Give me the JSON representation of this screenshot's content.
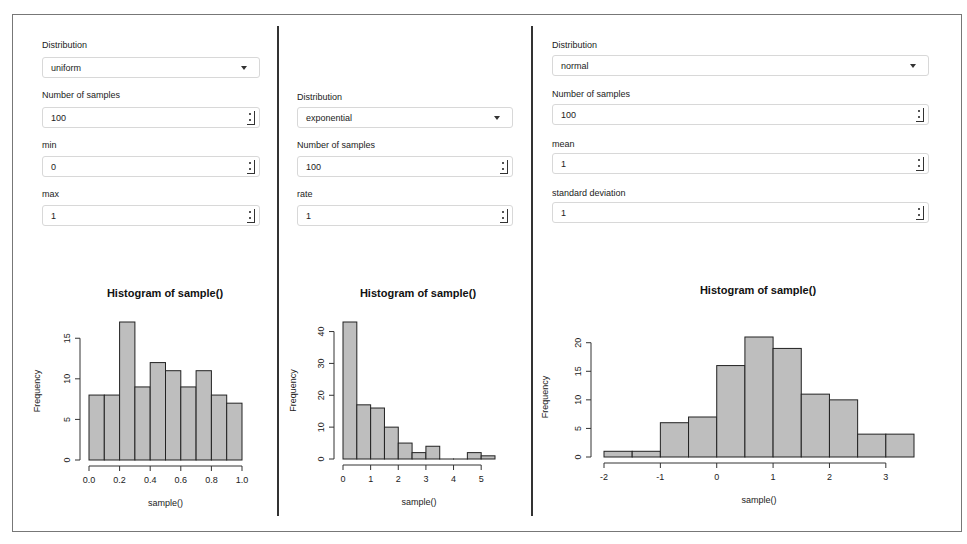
{
  "panels": [
    {
      "distribution_label": "Distribution",
      "distribution_value": "uniform",
      "fields": [
        {
          "label": "Number of samples",
          "value": "100"
        },
        {
          "label": "min",
          "value": "0"
        },
        {
          "label": "max",
          "value": "1"
        }
      ]
    },
    {
      "distribution_label": "Distribution",
      "distribution_value": "exponential",
      "fields": [
        {
          "label": "Number of samples",
          "value": "100"
        },
        {
          "label": "rate",
          "value": "1"
        }
      ]
    },
    {
      "distribution_label": "Distribution",
      "distribution_value": "normal",
      "fields": [
        {
          "label": "Number of samples",
          "value": "100"
        },
        {
          "label": "mean",
          "value": "1"
        },
        {
          "label": "standard deviation",
          "value": "1"
        }
      ]
    }
  ],
  "colors": {
    "bar_fill": "#bebebe",
    "bar_stroke": "#222222",
    "frame": "#777777",
    "divider": "#333333"
  },
  "chart_data": [
    {
      "type": "bar",
      "title": "Histogram of sample()",
      "xlabel": "sample()",
      "ylabel": "Frequency",
      "bin_edges": [
        0.0,
        0.1,
        0.2,
        0.3,
        0.4,
        0.5,
        0.6,
        0.7,
        0.8,
        0.9,
        1.0
      ],
      "values": [
        8,
        8,
        17,
        9,
        12,
        11,
        9,
        11,
        8,
        7
      ],
      "xticks": [
        "0.0",
        "0.2",
        "0.4",
        "0.6",
        "0.8",
        "1.0"
      ],
      "yticks": [
        "0",
        "5",
        "10",
        "15"
      ],
      "xlim": [
        0,
        1
      ],
      "ylim": [
        0,
        17
      ]
    },
    {
      "type": "bar",
      "title": "Histogram of sample()",
      "xlabel": "sample()",
      "ylabel": "Frequency",
      "bin_edges": [
        0,
        0.5,
        1.0,
        1.5,
        2.0,
        2.5,
        3.0,
        3.5,
        4.0,
        4.5,
        5.0,
        5.5
      ],
      "values": [
        43,
        17,
        16,
        10,
        5,
        2,
        4,
        0,
        0,
        2,
        1
      ],
      "xticks": [
        "0",
        "1",
        "2",
        "3",
        "4",
        "5"
      ],
      "yticks": [
        "0",
        "10",
        "20",
        "30",
        "40"
      ],
      "xlim": [
        0,
        5.5
      ],
      "ylim": [
        0,
        43
      ]
    },
    {
      "type": "bar",
      "title": "Histogram of sample()",
      "xlabel": "sample()",
      "ylabel": "Frequency",
      "bin_edges": [
        -2.0,
        -1.5,
        -1.0,
        -0.5,
        0.0,
        0.5,
        1.0,
        1.5,
        2.0,
        2.5,
        3.0,
        3.5
      ],
      "values": [
        1,
        1,
        6,
        7,
        16,
        21,
        19,
        11,
        10,
        4,
        4
      ],
      "xticks": [
        "-2",
        "-1",
        "0",
        "1",
        "2",
        "3"
      ],
      "yticks": [
        "0",
        "5",
        "10",
        "15",
        "20"
      ],
      "xlim": [
        -2,
        3.5
      ],
      "ylim": [
        0,
        21
      ]
    }
  ]
}
